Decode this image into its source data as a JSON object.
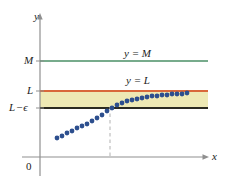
{
  "figure": {
    "background": "#ffffff"
  },
  "labels": {
    "y_axis": "y",
    "x_axis": "x",
    "origin": "0",
    "tick_M": "M",
    "tick_L": "L",
    "tick_L_minus_eps_lead": "L",
    "tick_L_minus_eps_op": "−",
    "tick_L_minus_eps_eps": "ϵ",
    "line_M_label": "y = M",
    "line_L_label": "y = L"
  },
  "colors": {
    "line_M": "#4a8f66",
    "line_L": "#d9683a",
    "band_fill": "#eee9b4",
    "band_bottom": "#2b2a20",
    "points": "#2d4f8e",
    "axis": "#8f8f8f",
    "dashed_guide": "#b9b9b9",
    "text": "#1b1b1b"
  },
  "chart_data": {
    "type": "scatter",
    "title": "",
    "xlabel": "x",
    "ylabel": "y",
    "grid": false,
    "legend": null,
    "xlim": [
      0,
      226
    ],
    "ylim": [
      0,
      187
    ],
    "axes_px": {
      "y_axis_x": 40,
      "x_axis_y": 157,
      "y_axis_top": 16,
      "x_axis_right": 208
    },
    "reference_lines": [
      {
        "name": "y = M",
        "label": "y = M",
        "value_label": "M",
        "y_px": 61,
        "x_start_px": 40,
        "x_end_px": 208,
        "color": "#4a8f66",
        "style": "solid",
        "width": 1.4
      },
      {
        "name": "y = L",
        "label": "y = L",
        "value_label": "L",
        "y_px": 91,
        "x_start_px": 40,
        "x_end_px": 208,
        "color": "#d9683a",
        "style": "solid",
        "width": 1.8
      },
      {
        "name": "y = L - epsilon",
        "label": "L − ϵ",
        "value_label": "L − ϵ",
        "y_px": 108,
        "x_start_px": 40,
        "x_end_px": 208,
        "color": "#2b2a20",
        "style": "solid",
        "width": 1.8
      }
    ],
    "shaded_band": {
      "name": "epsilon-band",
      "y_top_px": 91,
      "y_bottom_px": 108,
      "x_start_px": 40,
      "x_end_px": 208,
      "fill": "#eee9b4",
      "meaning": "L − ϵ < y < L"
    },
    "guide_line": {
      "name": "N-guide",
      "x_px": 110,
      "y_top_px": 107,
      "y_bottom_px": 157,
      "color": "#b9b9b9",
      "style": "dashed"
    },
    "points_px": [
      [
        57,
        138
      ],
      [
        62,
        136
      ],
      [
        67,
        133
      ],
      [
        72,
        131
      ],
      [
        77,
        128
      ],
      [
        82,
        126
      ],
      [
        87,
        124
      ],
      [
        92,
        121
      ],
      [
        97,
        118
      ],
      [
        102,
        115
      ],
      [
        107,
        111
      ],
      [
        112,
        108
      ],
      [
        117,
        105
      ],
      [
        122,
        103
      ],
      [
        127,
        101
      ],
      [
        132,
        100
      ],
      [
        137,
        99
      ],
      [
        142,
        98
      ],
      [
        147,
        97
      ],
      [
        152,
        96
      ],
      [
        157,
        96
      ],
      [
        162,
        95
      ],
      [
        167,
        95
      ],
      [
        172,
        94
      ],
      [
        177,
        94
      ],
      [
        182,
        94
      ],
      [
        187,
        93
      ]
    ],
    "point_color": "#2d4f8e",
    "point_size_px": 2.4
  }
}
